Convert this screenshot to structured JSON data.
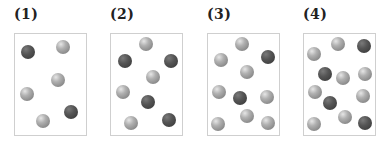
{
  "panels": [
    {
      "label": "(1)",
      "box": {
        "left": 14,
        "top": 33
      },
      "balls": [
        {
          "type": "dark",
          "x": 28,
          "y": 52
        },
        {
          "type": "light",
          "x": 63,
          "y": 47
        },
        {
          "type": "light",
          "x": 58,
          "y": 80
        },
        {
          "type": "light",
          "x": 27,
          "y": 94
        },
        {
          "type": "dark",
          "x": 71,
          "y": 112
        },
        {
          "type": "light",
          "x": 43,
          "y": 121
        }
      ]
    },
    {
      "label": "(2)",
      "box": {
        "left": 110,
        "top": 33
      },
      "balls": [
        {
          "type": "light",
          "x": 146,
          "y": 44
        },
        {
          "type": "dark",
          "x": 125,
          "y": 61
        },
        {
          "type": "dark",
          "x": 171,
          "y": 61
        },
        {
          "type": "light",
          "x": 153,
          "y": 77
        },
        {
          "type": "light",
          "x": 123,
          "y": 92
        },
        {
          "type": "dark",
          "x": 148,
          "y": 102
        },
        {
          "type": "dark",
          "x": 169,
          "y": 120
        },
        {
          "type": "light",
          "x": 131,
          "y": 123
        }
      ]
    },
    {
      "label": "(3)",
      "box": {
        "left": 207,
        "top": 33
      },
      "balls": [
        {
          "type": "light",
          "x": 242,
          "y": 44
        },
        {
          "type": "light",
          "x": 221,
          "y": 60
        },
        {
          "type": "dark",
          "x": 268,
          "y": 57
        },
        {
          "type": "light",
          "x": 247,
          "y": 72
        },
        {
          "type": "light",
          "x": 219,
          "y": 92
        },
        {
          "type": "dark",
          "x": 240,
          "y": 98
        },
        {
          "type": "light",
          "x": 267,
          "y": 97
        },
        {
          "type": "light",
          "x": 247,
          "y": 116
        },
        {
          "type": "light",
          "x": 218,
          "y": 124
        },
        {
          "type": "light",
          "x": 268,
          "y": 123
        }
      ]
    },
    {
      "label": "(4)",
      "box": {
        "left": 303,
        "top": 33
      },
      "balls": [
        {
          "type": "light",
          "x": 338,
          "y": 44
        },
        {
          "type": "dark",
          "x": 364,
          "y": 46
        },
        {
          "type": "light",
          "x": 314,
          "y": 54
        },
        {
          "type": "dark",
          "x": 325,
          "y": 74
        },
        {
          "type": "light",
          "x": 343,
          "y": 78
        },
        {
          "type": "light",
          "x": 365,
          "y": 74
        },
        {
          "type": "light",
          "x": 315,
          "y": 92
        },
        {
          "type": "light",
          "x": 363,
          "y": 96
        },
        {
          "type": "dark",
          "x": 330,
          "y": 103
        },
        {
          "type": "light",
          "x": 345,
          "y": 117
        },
        {
          "type": "light",
          "x": 314,
          "y": 124
        },
        {
          "type": "dark",
          "x": 365,
          "y": 123
        }
      ]
    }
  ]
}
